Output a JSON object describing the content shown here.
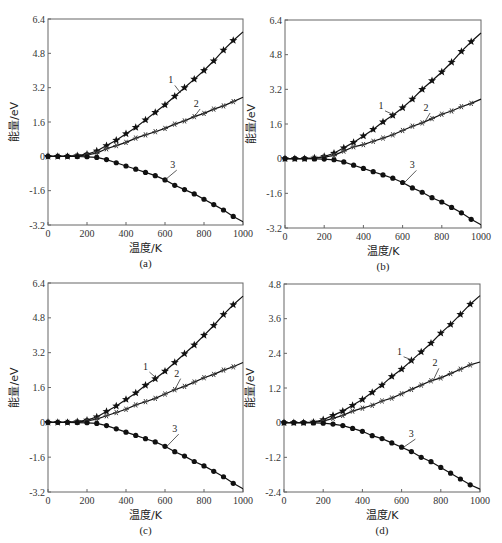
{
  "chart_data": [
    {
      "type": "line",
      "panel": "a",
      "caption": "(a)",
      "xlabel": "温度/K",
      "ylabel": "能量/eV",
      "xlim": [
        0,
        1000
      ],
      "ylim": [
        -3.2,
        6.4
      ],
      "xticks": [
        "0",
        "200",
        "400",
        "600",
        "800",
        "1000"
      ],
      "yticks": [
        "-3.2",
        "-1.6",
        "0",
        "1.6",
        "3.2",
        "4.8",
        "6.4"
      ],
      "grid": false,
      "x": [
        0,
        50,
        100,
        150,
        200,
        250,
        300,
        350,
        400,
        450,
        500,
        550,
        600,
        650,
        700,
        750,
        800,
        850,
        900,
        950,
        1000
      ],
      "series": [
        {
          "name": "1",
          "marker": "star",
          "values": [
            0,
            0,
            0,
            0.03,
            0.1,
            0.25,
            0.5,
            0.75,
            1.05,
            1.35,
            1.7,
            2.05,
            2.4,
            2.8,
            3.2,
            3.6,
            4.0,
            4.45,
            4.95,
            5.4,
            5.8
          ]
        },
        {
          "name": "2",
          "marker": "asterisk",
          "values": [
            0,
            0,
            0,
            0.02,
            0.07,
            0.15,
            0.35,
            0.5,
            0.65,
            0.85,
            1.0,
            1.15,
            1.3,
            1.5,
            1.65,
            1.85,
            2.0,
            2.2,
            2.35,
            2.55,
            2.75
          ]
        },
        {
          "name": "3",
          "marker": "circle",
          "values": [
            0,
            0,
            0,
            -0.01,
            -0.02,
            -0.05,
            -0.15,
            -0.3,
            -0.45,
            -0.6,
            -0.75,
            -0.9,
            -1.1,
            -1.35,
            -1.55,
            -1.75,
            -2.0,
            -2.25,
            -2.5,
            -2.8,
            -3.05
          ]
        }
      ],
      "annotations": [
        {
          "text": "1",
          "x": 640,
          "y": 3.4,
          "to_x": 680,
          "to_y": 2.95
        },
        {
          "text": "2",
          "x": 770,
          "y": 2.3,
          "to_x": 750,
          "to_y": 1.85
        },
        {
          "text": "3",
          "x": 650,
          "y": -0.55,
          "to_x": 600,
          "to_y": -1.1
        }
      ]
    },
    {
      "type": "line",
      "panel": "b",
      "caption": "(b)",
      "xlabel": "温度/K",
      "ylabel": "能量/eV",
      "xlim": [
        0,
        1000
      ],
      "ylim": [
        -3.2,
        6.4
      ],
      "xticks": [
        "0",
        "200",
        "400",
        "600",
        "800",
        "1000"
      ],
      "yticks": [
        "-3.2",
        "-1.6",
        "0",
        "1.6",
        "3.2",
        "4.8",
        "6.4"
      ],
      "grid": false,
      "x": [
        0,
        50,
        100,
        150,
        200,
        250,
        300,
        350,
        400,
        450,
        500,
        550,
        600,
        650,
        700,
        750,
        800,
        850,
        900,
        950,
        1000
      ],
      "series": [
        {
          "name": "1",
          "marker": "star",
          "values": [
            0,
            0,
            0,
            0.03,
            0.1,
            0.25,
            0.5,
            0.75,
            1.05,
            1.35,
            1.7,
            2.0,
            2.35,
            2.75,
            3.2,
            3.6,
            4.0,
            4.45,
            4.95,
            5.4,
            5.8
          ]
        },
        {
          "name": "2",
          "marker": "asterisk",
          "values": [
            0,
            0,
            0,
            0.02,
            0.07,
            0.15,
            0.35,
            0.55,
            0.65,
            0.8,
            0.95,
            1.1,
            1.3,
            1.5,
            1.65,
            1.85,
            2.05,
            2.2,
            2.4,
            2.55,
            2.75
          ]
        },
        {
          "name": "3",
          "marker": "circle",
          "values": [
            0,
            0,
            0,
            -0.01,
            -0.02,
            -0.05,
            -0.15,
            -0.3,
            -0.45,
            -0.6,
            -0.75,
            -0.9,
            -1.1,
            -1.35,
            -1.55,
            -1.8,
            -2.0,
            -2.25,
            -2.5,
            -2.8,
            -3.05
          ]
        }
      ],
      "annotations": [
        {
          "text": "1",
          "x": 500,
          "y": 2.3,
          "to_x": 560,
          "to_y": 2.0
        },
        {
          "text": "2",
          "x": 730,
          "y": 2.2,
          "to_x": 710,
          "to_y": 1.65
        },
        {
          "text": "3",
          "x": 660,
          "y": -0.45,
          "to_x": 610,
          "to_y": -1.1
        }
      ]
    },
    {
      "type": "line",
      "panel": "c",
      "caption": "(c)",
      "xlabel": "温度/K",
      "ylabel": "能量/eV",
      "xlim": [
        0,
        1000
      ],
      "ylim": [
        -3.2,
        6.4
      ],
      "xticks": [
        "0",
        "200",
        "400",
        "600",
        "800",
        "1000"
      ],
      "yticks": [
        "-3.2",
        "-1.6",
        "0",
        "1.6",
        "3.2",
        "4.8",
        "6.4"
      ],
      "grid": false,
      "x": [
        0,
        50,
        100,
        150,
        200,
        250,
        300,
        350,
        400,
        450,
        500,
        550,
        600,
        650,
        700,
        750,
        800,
        850,
        900,
        950,
        1000
      ],
      "series": [
        {
          "name": "1",
          "marker": "star",
          "values": [
            0,
            0,
            0,
            0.03,
            0.1,
            0.25,
            0.5,
            0.75,
            1.05,
            1.35,
            1.7,
            2.0,
            2.35,
            2.75,
            3.15,
            3.55,
            4.0,
            4.45,
            4.95,
            5.4,
            5.8
          ]
        },
        {
          "name": "2",
          "marker": "asterisk",
          "values": [
            0,
            0,
            0,
            0.02,
            0.07,
            0.15,
            0.3,
            0.45,
            0.6,
            0.8,
            0.95,
            1.1,
            1.3,
            1.5,
            1.65,
            1.85,
            2.05,
            2.2,
            2.4,
            2.55,
            2.75
          ]
        },
        {
          "name": "3",
          "marker": "circle",
          "values": [
            0,
            0,
            0,
            -0.01,
            -0.02,
            -0.05,
            -0.15,
            -0.3,
            -0.45,
            -0.6,
            -0.75,
            -0.9,
            -1.1,
            -1.35,
            -1.55,
            -1.8,
            -2.0,
            -2.25,
            -2.5,
            -2.8,
            -3.05
          ]
        }
      ],
      "annotations": [
        {
          "text": "1",
          "x": 510,
          "y": 2.4,
          "to_x": 560,
          "to_y": 2.0
        },
        {
          "text": "2",
          "x": 670,
          "y": 2.1,
          "to_x": 650,
          "to_y": 1.5
        },
        {
          "text": "3",
          "x": 660,
          "y": -0.45,
          "to_x": 610,
          "to_y": -1.1
        }
      ]
    },
    {
      "type": "line",
      "panel": "d",
      "caption": "(d)",
      "xlabel": "温度/K",
      "ylabel": "能量/eV",
      "xlim": [
        0,
        1000
      ],
      "ylim": [
        -2.4,
        4.8
      ],
      "xticks": [
        "0",
        "200",
        "400",
        "600",
        "800",
        "1000"
      ],
      "yticks": [
        "-2.4",
        "-1.2",
        "0",
        "1.2",
        "2.4",
        "3.6",
        "4.8"
      ],
      "grid": false,
      "x": [
        0,
        50,
        100,
        150,
        200,
        250,
        300,
        350,
        400,
        450,
        500,
        550,
        600,
        650,
        700,
        750,
        800,
        850,
        900,
        950,
        1000
      ],
      "series": [
        {
          "name": "1",
          "marker": "star",
          "values": [
            0,
            0,
            0,
            0.02,
            0.1,
            0.25,
            0.4,
            0.6,
            0.8,
            1.05,
            1.3,
            1.6,
            1.85,
            2.15,
            2.45,
            2.75,
            3.1,
            3.4,
            3.75,
            4.1,
            4.4
          ]
        },
        {
          "name": "2",
          "marker": "asterisk",
          "values": [
            0,
            0,
            0,
            0.01,
            0.05,
            0.15,
            0.25,
            0.4,
            0.5,
            0.6,
            0.75,
            0.85,
            1.0,
            1.15,
            1.3,
            1.45,
            1.55,
            1.7,
            1.85,
            2.0,
            2.1
          ]
        },
        {
          "name": "3",
          "marker": "circle",
          "values": [
            0,
            0,
            0,
            -0.01,
            -0.02,
            -0.05,
            -0.1,
            -0.2,
            -0.3,
            -0.45,
            -0.55,
            -0.7,
            -0.85,
            -1.0,
            -1.2,
            -1.35,
            -1.55,
            -1.75,
            -1.95,
            -2.15,
            -2.3
          ]
        }
      ],
      "annotations": [
        {
          "text": "1",
          "x": 600,
          "y": 2.35,
          "to_x": 660,
          "to_y": 2.15
        },
        {
          "text": "2",
          "x": 780,
          "y": 1.95,
          "to_x": 760,
          "to_y": 1.45
        },
        {
          "text": "3",
          "x": 660,
          "y": -0.5,
          "to_x": 610,
          "to_y": -0.85
        }
      ]
    }
  ],
  "layout": {
    "panels": [
      {
        "left": 48,
        "top": 19,
        "right": 243,
        "bottom": 225
      },
      {
        "left": 285,
        "top": 20,
        "right": 481,
        "bottom": 228
      },
      {
        "left": 48,
        "top": 283,
        "right": 243,
        "bottom": 492
      },
      {
        "left": 284,
        "top": 284,
        "right": 480,
        "bottom": 492
      }
    ]
  }
}
